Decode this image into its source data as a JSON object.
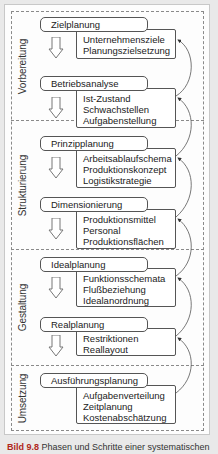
{
  "phases": [
    {
      "label": "Vorbereitung"
    },
    {
      "label": "Strukturierung"
    },
    {
      "label": "Gestaltung"
    },
    {
      "label": "Umsetzung"
    }
  ],
  "steps": [
    {
      "title": "Zielplanung",
      "items": [
        "Unternehmensziele",
        "Planungszielsetzung"
      ]
    },
    {
      "title": "Betriebsanalyse",
      "items": [
        "Ist-Zustand",
        "Schwachstellen",
        "Aufgabenstellung"
      ]
    },
    {
      "title": "Prinzipplanung",
      "items": [
        "Arbeitsablaufschema",
        "Produktionskonzept",
        "Logistikstrategie"
      ]
    },
    {
      "title": "Dimensionierung",
      "items": [
        "Produktionsmittel",
        "Personal",
        "Produktionsflächen"
      ]
    },
    {
      "title": "Idealplanung",
      "items": [
        "Funktionsschemata",
        "Flußbeziehung",
        "Idealanordnung"
      ]
    },
    {
      "title": "Realplanung",
      "items": [
        "Restriktionen",
        "Reallayout"
      ]
    },
    {
      "title": "Ausführungsplanung",
      "items": [
        "Aufgabenverteilung",
        "Zeitplanung",
        "Kostenabschätzung"
      ]
    }
  ],
  "caption": {
    "label": "Bild 9.8",
    "text": "Phasen und Schritte einer systematischen"
  },
  "colors": {
    "page_background": "#e9e9e9",
    "frame": "#fdfdfd",
    "caption_label": "#b0271b",
    "lines": "#555555"
  }
}
